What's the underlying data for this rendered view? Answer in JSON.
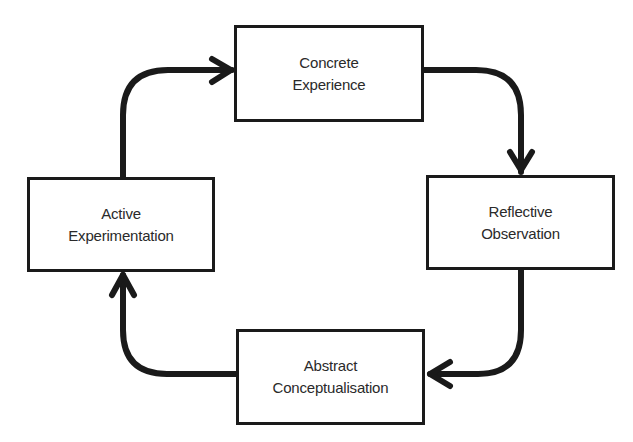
{
  "diagram": {
    "stages": [
      {
        "id": "concrete-experience",
        "line1": "Concrete",
        "line2": "Experience"
      },
      {
        "id": "reflective-observation",
        "line1": "Reflective",
        "line2": "Observation"
      },
      {
        "id": "abstract-conceptualisation",
        "line1": "Abstract",
        "line2": "Conceptualisation"
      },
      {
        "id": "active-experimentation",
        "line1": "Active",
        "line2": "Experimentation"
      }
    ],
    "flow": [
      {
        "from": "concrete-experience",
        "to": "reflective-observation"
      },
      {
        "from": "reflective-observation",
        "to": "abstract-conceptualisation"
      },
      {
        "from": "abstract-conceptualisation",
        "to": "active-experimentation"
      },
      {
        "from": "active-experimentation",
        "to": "concrete-experience"
      }
    ],
    "colors": {
      "stroke": "#1a1a1a",
      "text": "#2a2a2a",
      "background": "#ffffff"
    }
  }
}
